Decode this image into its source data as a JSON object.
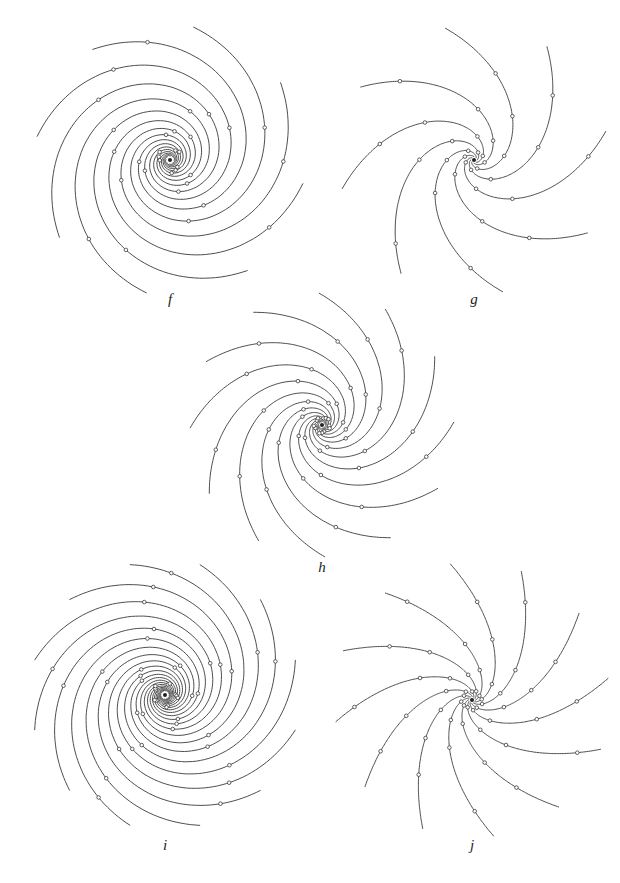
{
  "page": {
    "background": "#ffffff",
    "stroke_color": "#3a3a3a"
  },
  "figures": [
    {
      "id": "f",
      "label": "f",
      "center": [
        170,
        160
      ],
      "arms": 8,
      "rotation_deg": 10,
      "spiral_tightness": 0.28,
      "r_min": 4,
      "r_max": 135,
      "marker_radii": [
        12,
        30,
        62,
        110
      ],
      "label_pos": [
        170,
        292
      ]
    },
    {
      "id": "g",
      "label": "g",
      "center": [
        474,
        160
      ],
      "arms": 8,
      "rotation_deg": 5,
      "spiral_tightness": 0.9,
      "r_min": 3,
      "r_max": 135,
      "marker_radii": [
        10,
        28,
        60,
        105
      ],
      "label_pos": [
        474,
        292
      ]
    },
    {
      "id": "h",
      "label": "h",
      "center": [
        322,
        425
      ],
      "arms": 12,
      "rotation_deg": 0,
      "spiral_tightness": 0.6,
      "r_min": 3,
      "r_max": 132,
      "marker_radii": [
        8,
        25,
        55,
        100
      ],
      "label_pos": [
        322,
        560
      ]
    },
    {
      "id": "i",
      "label": "i",
      "center": [
        165,
        695
      ],
      "arms": 12,
      "rotation_deg": 15,
      "spiral_tightness": 0.32,
      "r_min": 4,
      "r_max": 135,
      "marker_radii": [
        12,
        32,
        65,
        112
      ],
      "label_pos": [
        165,
        838
      ]
    },
    {
      "id": "j",
      "label": "j",
      "center": [
        472,
        700
      ],
      "arms": 12,
      "rotation_deg": 8,
      "spiral_tightness": 1.6,
      "r_min": 3,
      "r_max": 138,
      "marker_radii": [
        10,
        30,
        62,
        108
      ],
      "label_pos": [
        472,
        838
      ]
    }
  ]
}
